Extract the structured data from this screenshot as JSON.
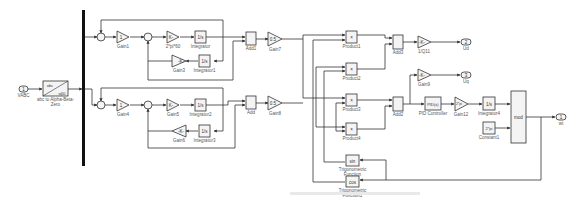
{
  "diagram": {
    "type": "simulink-block-diagram",
    "blocks": {
      "vabc_in": {
        "port": "1",
        "label": "VABC"
      },
      "abc_transform": {
        "top": "abc",
        "bottom": "αβ0",
        "label": "abc to Alpha-Beta-Zero"
      },
      "gain1": {
        "value": "1",
        "label": "Gain1"
      },
      "gain_2pi": {
        "value": "K-",
        "label": "2*pi*60"
      },
      "integrator": {
        "value": "1/s",
        "label": "Integrator"
      },
      "gain3": {
        "value": "-K-",
        "label": "Gain3"
      },
      "integrator1": {
        "value": "1/s",
        "label": "Integrator1"
      },
      "gain4": {
        "value": "1",
        "label": "Gain4"
      },
      "gain5": {
        "value": "K-",
        "label": "Gain5"
      },
      "integrator2": {
        "value": "1/s",
        "label": "Integrator2"
      },
      "gain6": {
        "value": "-K-",
        "label": "Gain6"
      },
      "integrator3": {
        "value": "1/s",
        "label": "Integrator3"
      },
      "add1": {
        "label": "Add1"
      },
      "gain7": {
        "value": "0.5",
        "label": "Gain7"
      },
      "add": {
        "label": "Add"
      },
      "gain8": {
        "value": "0.5",
        "label": "Gain8"
      },
      "product1": {
        "value": "×",
        "label": "Product1"
      },
      "product2": {
        "value": "×",
        "label": "Product2"
      },
      "product3": {
        "value": "×",
        "label": "Product3"
      },
      "product4": {
        "value": "×",
        "label": "Product4"
      },
      "add3": {
        "label": "Add3"
      },
      "add2": {
        "label": "Add2"
      },
      "gain_1q": {
        "value": "-K-",
        "label": "1/Q11"
      },
      "gain9": {
        "value": "-K-",
        "label": "Gain9"
      },
      "out_ud": {
        "port": "2",
        "label": "Ud"
      },
      "out_uq": {
        "port": "3",
        "label": "Uq"
      },
      "pid": {
        "value": "PID(s)",
        "label": "PID Controller"
      },
      "gain12": {
        "value": "2*pi",
        "label": "Gain12"
      },
      "integrator4": {
        "value": "1/s",
        "label": "Integrator4"
      },
      "constant1": {
        "value": "2*pi",
        "label": "Constant1"
      },
      "mod": {
        "value": "mod",
        "label": ""
      },
      "out_wt": {
        "port": "1",
        "label": "wt"
      },
      "trig_sin": {
        "value": "sin",
        "label": "Trigonometric Function"
      },
      "trig_cos": {
        "value": "cos",
        "label": "Trigonometric Function1"
      }
    }
  }
}
